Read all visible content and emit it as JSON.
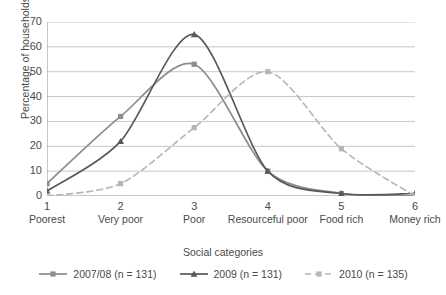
{
  "chart_data": {
    "type": "line",
    "title": "",
    "xlabel": "Social categories",
    "ylabel": "Percentage of households",
    "ylim": [
      0,
      70
    ],
    "ytick_step": 10,
    "yticks": [
      70,
      60,
      50,
      40,
      30,
      20,
      10,
      0
    ],
    "grid": true,
    "legend_position": "bottom",
    "categories": [
      "1",
      "2",
      "3",
      "4",
      "5",
      "6"
    ],
    "category_names": [
      "Poorest",
      "Very poor",
      "Poor",
      "Resourceful poor",
      "Food rich",
      "Money rich"
    ],
    "series": [
      {
        "name": "2007/08 (n = 131)",
        "values": [
          5,
          32,
          53,
          10,
          1,
          0
        ],
        "color": "#8c8c8c",
        "marker": "square",
        "dash": "solid"
      },
      {
        "name": "2009 (n = 131)",
        "values": [
          2,
          22,
          65,
          10,
          1,
          1
        ],
        "color": "#595959",
        "marker": "triangle",
        "dash": "solid"
      },
      {
        "name": "2010 (n = 135)",
        "values": [
          0,
          5,
          27.5,
          50,
          19,
          0
        ],
        "color": "#b5b5b5",
        "marker": "square",
        "dash": "dashed"
      }
    ]
  },
  "axis": {
    "y_title": "Percentage of households",
    "x_title": "Social categories",
    "y_ticks": [
      "70",
      "60",
      "50",
      "40",
      "30",
      "20",
      "10",
      "0"
    ],
    "x_ticks": [
      "1",
      "2",
      "3",
      "4",
      "5",
      "6"
    ],
    "x_tick_names": [
      "Poorest",
      "Very poor",
      "Poor",
      "Resourceful poor",
      "Food rich",
      "Money rich"
    ]
  },
  "legend": {
    "items": [
      {
        "label": "2007/08 (n = 131)"
      },
      {
        "label": "2009 (n = 131)"
      },
      {
        "label": "2010 (n = 135)"
      }
    ]
  }
}
